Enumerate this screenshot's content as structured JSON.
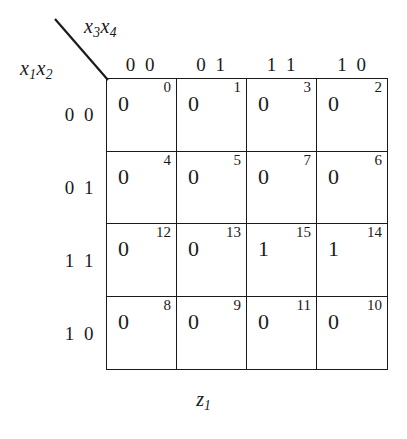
{
  "diagram": {
    "type": "karnaugh-map",
    "caption_text": "z",
    "caption_sub": "1",
    "column_axis": {
      "var1": "x",
      "var1_sub": "3",
      "var2": "x",
      "var2_sub": "4"
    },
    "row_axis": {
      "var1": "x",
      "var1_sub": "1",
      "var2": "x",
      "var2_sub": "2"
    },
    "column_headers": [
      "0 0",
      "0 1",
      "1 1",
      "1 0"
    ],
    "row_headers": [
      "0 0",
      "0 1",
      "1 1",
      "1 0"
    ],
    "cells": [
      {
        "minterm": "0",
        "value": "0"
      },
      {
        "minterm": "1",
        "value": "0"
      },
      {
        "minterm": "3",
        "value": "0"
      },
      {
        "minterm": "2",
        "value": "0"
      },
      {
        "minterm": "4",
        "value": "0"
      },
      {
        "minterm": "5",
        "value": "0"
      },
      {
        "minterm": "7",
        "value": "0"
      },
      {
        "minterm": "6",
        "value": "0"
      },
      {
        "minterm": "12",
        "value": "0"
      },
      {
        "minterm": "13",
        "value": "0"
      },
      {
        "minterm": "15",
        "value": "1"
      },
      {
        "minterm": "14",
        "value": "1"
      },
      {
        "minterm": "8",
        "value": "0"
      },
      {
        "minterm": "9",
        "value": "0"
      },
      {
        "minterm": "11",
        "value": "0"
      },
      {
        "minterm": "10",
        "value": "0"
      }
    ],
    "colors": {
      "ink": "#1a1a1a",
      "background": "#ffffff"
    }
  }
}
